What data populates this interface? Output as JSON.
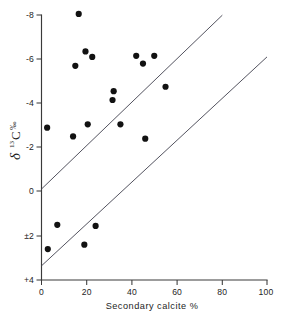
{
  "chart_data": {
    "type": "scatter",
    "title": "",
    "xlabel": "Secondary calcite %",
    "ylabel": "δ 13C ‰",
    "ylabel_parts": {
      "symbol": "δ",
      "superscript": "13",
      "element": "C",
      "units": "‰"
    },
    "xlim": [
      0,
      100
    ],
    "ylim": [
      -8,
      4
    ],
    "y_axis_inverted": true,
    "grid": false,
    "legend": null,
    "xticks": [
      0,
      20,
      40,
      60,
      80,
      100
    ],
    "xtick_labels": [
      "0",
      "20",
      "40",
      "60",
      "80",
      "100"
    ],
    "yticks": [
      -8,
      -6,
      -4,
      -2,
      0,
      2,
      4
    ],
    "ytick_labels": [
      "-8",
      "-6",
      "-4",
      "-2",
      "0",
      "±2",
      "+4"
    ],
    "points": [
      {
        "x": 16.5,
        "y": -8.05
      },
      {
        "x": 19.5,
        "y": -6.35
      },
      {
        "x": 22.5,
        "y": -6.1
      },
      {
        "x": 15.0,
        "y": -5.7
      },
      {
        "x": 42.0,
        "y": -6.15
      },
      {
        "x": 50.0,
        "y": -6.15
      },
      {
        "x": 45.0,
        "y": -5.8
      },
      {
        "x": 32.0,
        "y": -4.55
      },
      {
        "x": 31.5,
        "y": -4.15
      },
      {
        "x": 55.0,
        "y": -4.75
      },
      {
        "x": 2.5,
        "y": -2.9
      },
      {
        "x": 14.0,
        "y": -2.5
      },
      {
        "x": 20.5,
        "y": -3.05
      },
      {
        "x": 35.0,
        "y": -3.05
      },
      {
        "x": 46.0,
        "y": -2.4
      },
      {
        "x": 7.0,
        "y": 1.5
      },
      {
        "x": 24.0,
        "y": 1.55
      },
      {
        "x": 19.0,
        "y": 2.4
      },
      {
        "x": 2.8,
        "y": 2.6
      }
    ],
    "trend_lines": [
      {
        "name": "upper-bound-line",
        "x_start": 0,
        "y_start": 0.1,
        "x_end": 80,
        "y_end": -8.05
      },
      {
        "name": "lower-bound-line",
        "x_start": 0,
        "y_start": 3.4,
        "x_end": 100,
        "y_end": -6.35
      }
    ]
  },
  "axes": {
    "x_axis_title": "Secondary calcite %",
    "y_axis_title": "δ 13C ‰"
  }
}
